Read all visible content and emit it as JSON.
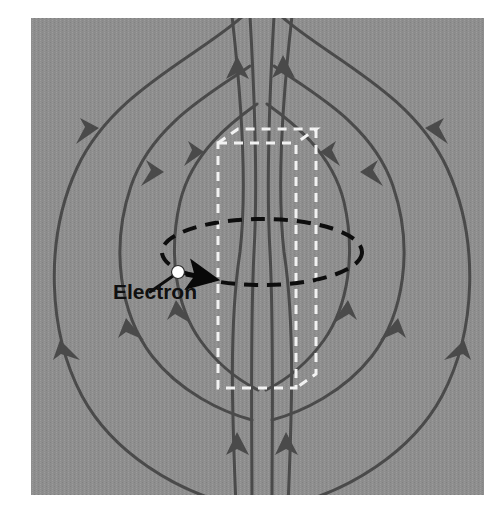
{
  "figure": {
    "canvas": {
      "width": 504,
      "height": 520,
      "background": "#ffffff"
    },
    "panel": {
      "name": "gray-photo-panel",
      "x": 31,
      "y": 18,
      "width": 453,
      "height": 477,
      "fill": "#8e8e8e",
      "noise": "halftone-dither"
    },
    "colors": {
      "panel_background": "#8e8e8e",
      "field_line": "#4a4a4a",
      "arrowhead": "#4a4a4a",
      "orbit_dash": "#0d0d0d",
      "solenoid_box": "#f2f2f2",
      "electron_dot": "#ffffff",
      "electron_dot_outline": "#2b2b2b",
      "velocity_arrow": "#080808",
      "label_text": "#101010",
      "page_background": "#ffffff"
    },
    "labels": [
      {
        "name": "electron-label",
        "text": "Electron",
        "x": 113,
        "y": 299,
        "font_size": 21,
        "font_weight": "bold",
        "color": "#101010"
      }
    ],
    "electron": {
      "name": "electron-particle",
      "cx": 178,
      "cy": 272,
      "r": 6,
      "fill": "#ffffff",
      "leader_line": {
        "x1": 150,
        "y1": 292,
        "x2": 173,
        "y2": 276
      },
      "velocity_arrow": {
        "name": "velocity-arrow",
        "x1": 186,
        "y1": 274,
        "x2": 217,
        "y2": 280,
        "direction": "right",
        "color": "#080808"
      }
    },
    "orbit": {
      "name": "electron-orbit-ellipse",
      "cx": 262,
      "cy": 252,
      "rx": 100,
      "ry": 33,
      "stroke": "#0d0d0d",
      "stroke_width": 4,
      "dash": "14 9",
      "style": "dashed"
    },
    "solenoid_box": {
      "name": "solenoid-dashed-box",
      "style": "dashed-3d-rectangular-prism",
      "stroke": "#f2f2f2",
      "stroke_width": 3,
      "dash": "9 7",
      "front_face": {
        "x": 218,
        "y": 143,
        "width": 78,
        "height": 245
      },
      "depth_offset_x": 20,
      "depth_offset_y": -14
    },
    "field_lines": {
      "name": "magnetic-field-lines",
      "stroke": "#4a4a4a",
      "stroke_width": 3,
      "count": 8,
      "description": "Dipole field loops: upward through the solenoid core, outward over the top, down the sides, and back in at the bottom.",
      "arrow_direction_summary": {
        "center_top": "up",
        "center_bottom": "up",
        "left_upper": "down-left",
        "left_lower": "down",
        "right_upper": "down-right",
        "right_lower": "down"
      }
    }
  }
}
